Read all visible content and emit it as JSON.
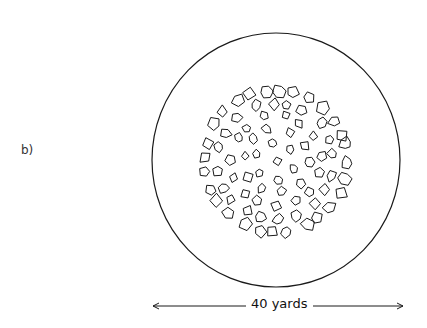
{
  "figure": {
    "panel_label": "b)",
    "scale_label": "40 yards",
    "ink_color": "#1a1a1a",
    "background": "#ffffff"
  },
  "outer_circle": {
    "cx": 276,
    "cy": 160,
    "rx": 124,
    "ry": 127
  },
  "inner_area": {
    "cx": 276,
    "cy": 161,
    "r": 77
  },
  "scale_bar": {
    "x1": 153,
    "x2": 403,
    "y": 306
  },
  "stone_rings": [
    {
      "r": 0,
      "count": 1,
      "size": 4.5
    },
    {
      "r": 19,
      "count": 6,
      "size": 4.5
    },
    {
      "r": 32,
      "count": 10,
      "size": 5
    },
    {
      "r": 45,
      "count": 15,
      "size": 5
    },
    {
      "r": 58,
      "count": 20,
      "size": 5.5
    },
    {
      "r": 71,
      "count": 28,
      "size": 6.5
    }
  ]
}
